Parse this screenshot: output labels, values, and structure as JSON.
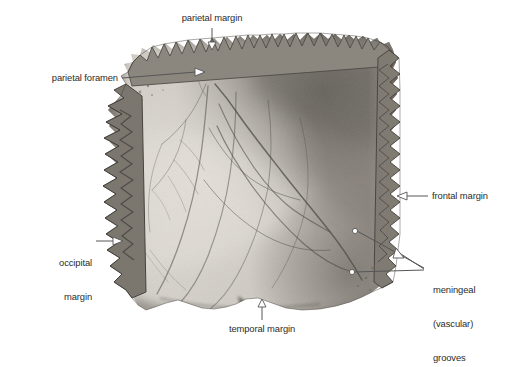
{
  "figure": {
    "background_color": "#ffffff",
    "bone_tone_light": "#cfcbc4",
    "bone_tone_mid": "#a9a49c",
    "bone_tone_dark": "#6e6a64",
    "groove_color": "#4a4743",
    "leader_color": "#555555",
    "label_color": "#2b2b2b"
  },
  "labels": {
    "parietal_margin": "parietal margin",
    "parietal_foramen": "parietal foramen",
    "frontal_margin": "frontal margin",
    "occipital_margin_line1": "occipital",
    "occipital_margin_line2": "margin",
    "temporal_margin": "temporal margin",
    "meningeal_line1": "meningeal",
    "meningeal_line2": "(vascular)",
    "meningeal_line3": "grooves"
  }
}
